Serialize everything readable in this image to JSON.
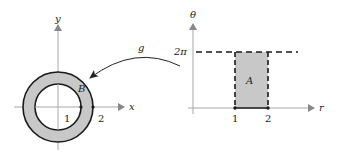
{
  "left": {
    "x_axis_label": "x",
    "y_axis_label": "y",
    "region_label": "B",
    "tick_1": "1",
    "tick_2": "2",
    "inner_radius": 1,
    "outer_radius": 2
  },
  "arrow": {
    "label": "g"
  },
  "right": {
    "h_axis_label": "r",
    "v_axis_label": "θ",
    "region_label": "A",
    "y_tick": "2π",
    "tick_1": "1",
    "tick_2": "2"
  },
  "colors": {
    "fill": "#c8c8c8",
    "axis": "#a8a8a8",
    "stroke": "#1a1a1a"
  }
}
